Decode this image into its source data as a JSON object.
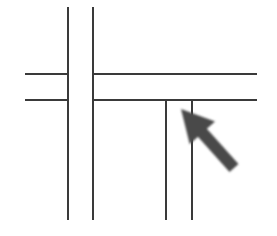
{
  "diagram": {
    "colors": {
      "line": "#3a3a3a",
      "arrow": "#4a4a4a",
      "background": "#ffffff"
    },
    "lines": [
      {
        "id": "v1",
        "x1": 68,
        "y1": 7,
        "x2": 68,
        "y2": 220
      },
      {
        "id": "v2",
        "x1": 93,
        "y1": 7,
        "x2": 93,
        "y2": 220
      },
      {
        "id": "h1-left",
        "x1": 25,
        "y1": 74,
        "x2": 68,
        "y2": 74
      },
      {
        "id": "h2-left",
        "x1": 25,
        "y1": 100,
        "x2": 68,
        "y2": 100
      },
      {
        "id": "h1-right",
        "x1": 93,
        "y1": 74,
        "x2": 257,
        "y2": 74
      },
      {
        "id": "h2-right",
        "x1": 93,
        "y1": 100,
        "x2": 257,
        "y2": 100
      },
      {
        "id": "v3",
        "x1": 166,
        "y1": 100,
        "x2": 166,
        "y2": 220
      },
      {
        "id": "v4",
        "x1": 192,
        "y1": 100,
        "x2": 192,
        "y2": 220
      }
    ],
    "arrow": {
      "tip_x": 181,
      "tip_y": 109,
      "tail_x": 234,
      "tail_y": 168
    }
  }
}
